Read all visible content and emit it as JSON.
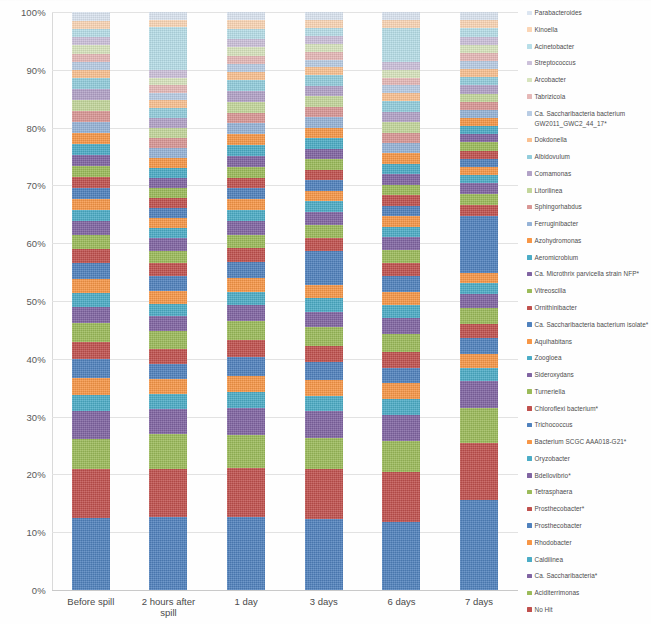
{
  "chart_data": {
    "type": "bar",
    "stacked": true,
    "stack_mode": "percent",
    "title": "",
    "xlabel": "",
    "ylabel": "",
    "ylim": [
      0,
      100
    ],
    "ytick_labels": [
      "0%",
      "10%",
      "20%",
      "30%",
      "40%",
      "50%",
      "60%",
      "70%",
      "80%",
      "90%",
      "100%"
    ],
    "ytick_values": [
      0,
      10,
      20,
      30,
      40,
      50,
      60,
      70,
      80,
      90,
      100
    ],
    "grid": true,
    "legend_position": "right",
    "categories": [
      "Before spill",
      "2 hours after spill",
      "1 day",
      "3 days",
      "6 days",
      "7 days"
    ],
    "series": [
      {
        "name": "Flavobacterium",
        "color": "#4f81bd",
        "values": [
          13.0,
          14.5,
          13.5,
          13.5,
          13.0,
          16.5
        ]
      },
      {
        "name": "No Hit",
        "color": "#c0504d",
        "values": [
          9.0,
          9.5,
          9.0,
          9.5,
          9.5,
          10.5
        ]
      },
      {
        "name": "Aciditerrimonas",
        "color": "#9bbb59",
        "values": [
          5.5,
          7.0,
          6.0,
          6.0,
          6.0,
          6.5
        ]
      },
      {
        "name": "Ca. Saccharibacteria*",
        "color": "#8064a2",
        "values": [
          5.0,
          5.0,
          5.0,
          5.0,
          5.0,
          5.0
        ]
      },
      {
        "name": "Caldilinea",
        "color": "#4bacc6",
        "values": [
          3.0,
          3.0,
          3.0,
          3.0,
          3.0,
          2.5
        ]
      },
      {
        "name": "Rhodobacter",
        "color": "#f79646",
        "values": [
          3.0,
          3.0,
          3.0,
          3.0,
          3.0,
          2.5
        ]
      },
      {
        "name": "Prosthecobacter",
        "color": "#4f81bd",
        "values": [
          3.5,
          3.0,
          3.5,
          3.5,
          3.0,
          3.0
        ]
      },
      {
        "name": "Prosthecobacter*",
        "color": "#c0504d",
        "values": [
          3.0,
          3.0,
          3.0,
          3.0,
          3.0,
          2.5
        ]
      },
      {
        "name": "Tetrasphaera",
        "color": "#9bbb59",
        "values": [
          3.5,
          3.5,
          3.5,
          3.5,
          3.5,
          3.0
        ]
      },
      {
        "name": "Bdellovibrio*",
        "color": "#8064a2",
        "values": [
          3.0,
          3.0,
          3.0,
          3.0,
          3.0,
          2.5
        ]
      },
      {
        "name": "Oryzobacter",
        "color": "#4bacc6",
        "values": [
          2.5,
          2.5,
          2.5,
          2.5,
          2.5,
          2.0
        ]
      },
      {
        "name": "Bacterium SCGC AAA018-G21*",
        "color": "#f79646",
        "values": [
          2.5,
          2.5,
          2.5,
          2.5,
          2.5,
          2.0
        ]
      },
      {
        "name": "Trichococcus",
        "color": "#4f81bd",
        "values": [
          3.0,
          3.0,
          3.0,
          6.5,
          3.0,
          10.5
        ]
      },
      {
        "name": "Chloroflexi bacterium*",
        "color": "#c0504d",
        "values": [
          2.5,
          2.5,
          2.5,
          2.5,
          2.5,
          2.0
        ]
      },
      {
        "name": "Turneriella",
        "color": "#9bbb59",
        "values": [
          2.5,
          2.5,
          2.5,
          2.5,
          2.5,
          2.0
        ]
      },
      {
        "name": "Sideroxydans",
        "color": "#8064a2",
        "values": [
          2.5,
          2.5,
          2.5,
          2.5,
          2.5,
          2.0
        ]
      },
      {
        "name": "Zoogloea",
        "color": "#4bacc6",
        "values": [
          2.0,
          2.0,
          2.0,
          2.0,
          2.0,
          1.5
        ]
      },
      {
        "name": "Aquihabitans",
        "color": "#f79646",
        "values": [
          2.0,
          2.0,
          2.0,
          2.0,
          2.0,
          1.5
        ]
      },
      {
        "name": "Ca. Saccharibacteria bacterium isolate*",
        "color": "#4f81bd",
        "values": [
          2.0,
          2.0,
          2.0,
          2.0,
          2.0,
          1.5
        ]
      },
      {
        "name": "Ornithinibacter",
        "color": "#c0504d",
        "values": [
          2.0,
          2.0,
          2.0,
          2.0,
          2.0,
          1.5
        ]
      },
      {
        "name": "Vitreoscilla",
        "color": "#9bbb59",
        "values": [
          2.0,
          2.0,
          2.0,
          2.0,
          2.0,
          1.5
        ]
      },
      {
        "name": "Ca. Microthrix parvicella strain NFP*",
        "color": "#8064a2",
        "values": [
          2.0,
          2.0,
          2.0,
          2.0,
          2.0,
          1.5
        ]
      },
      {
        "name": "Aeromicrobium",
        "color": "#4bacc6",
        "values": [
          2.0,
          2.0,
          2.0,
          2.0,
          2.0,
          1.5
        ]
      },
      {
        "name": "Azohydromonas",
        "color": "#f79646",
        "values": [
          2.0,
          2.0,
          2.0,
          2.0,
          2.0,
          1.5
        ]
      },
      {
        "name": "Ferruginibacter",
        "color": "#95b3d7",
        "values": [
          2.0,
          2.0,
          2.0,
          2.0,
          2.0,
          1.5
        ]
      },
      {
        "name": "Sphingorhabdus",
        "color": "#d99694",
        "values": [
          2.0,
          2.0,
          2.0,
          2.0,
          2.0,
          1.5
        ]
      },
      {
        "name": "Litorilinea",
        "color": "#c3d69b",
        "values": [
          2.0,
          2.0,
          2.0,
          2.0,
          2.0,
          1.5
        ]
      },
      {
        "name": "Comamonas",
        "color": "#b2a2c7",
        "values": [
          2.0,
          2.0,
          2.0,
          2.0,
          2.0,
          1.5
        ]
      },
      {
        "name": "Albidovulum",
        "color": "#92cddc",
        "values": [
          2.0,
          2.0,
          2.0,
          2.0,
          2.0,
          1.5
        ]
      },
      {
        "name": "Dokdonella",
        "color": "#fac090",
        "values": [
          1.5,
          1.5,
          1.5,
          1.5,
          1.5,
          1.5
        ]
      },
      {
        "name": "Ca. Saccharibacteria bacterium GW2011_GWC2_44_17*",
        "color": "#b8cce4",
        "values": [
          1.5,
          1.5,
          1.5,
          1.5,
          1.5,
          1.5
        ]
      },
      {
        "name": "Tabrizicola",
        "color": "#e6b8b7",
        "values": [
          1.5,
          1.5,
          1.5,
          1.5,
          1.5,
          1.5
        ]
      },
      {
        "name": "Arcobacter",
        "color": "#d7e4bd",
        "values": [
          1.5,
          1.5,
          1.5,
          1.5,
          1.5,
          1.5
        ]
      },
      {
        "name": "Streptococcus",
        "color": "#ccc0da",
        "values": [
          1.5,
          1.5,
          1.5,
          1.5,
          1.5,
          1.5
        ]
      },
      {
        "name": "Acinetobacter",
        "color": "#b7dee8",
        "values": [
          1.5,
          8.5,
          2.0,
          1.5,
          6.5,
          1.5
        ]
      },
      {
        "name": "Kinoella",
        "color": "#fbd5b5",
        "values": [
          1.5,
          1.5,
          1.5,
          1.5,
          1.5,
          1.5
        ]
      },
      {
        "name": "Parabacteroides",
        "color": "#dbe5f1",
        "values": [
          1.5,
          1.5,
          1.5,
          1.5,
          1.5,
          1.5
        ]
      }
    ],
    "legend_entries": [
      {
        "label": "Parabacteroides",
        "color": "#dbe5f1"
      },
      {
        "label": "Kinoella",
        "color": "#fbd5b5"
      },
      {
        "label": "Acinetobacter",
        "color": "#b7dee8"
      },
      {
        "label": "Streptococcus",
        "color": "#ccc0da"
      },
      {
        "label": "Arcobacter",
        "color": "#d7e4bd"
      },
      {
        "label": "Tabrizicola",
        "color": "#e6b8b7"
      },
      {
        "label": "Ca. Saccharibacteria bacterium GW2011_GWC2_44_17*",
        "color": "#b8cce4"
      },
      {
        "label": "Dokdonella",
        "color": "#fac090"
      },
      {
        "label": "Albidovulum",
        "color": "#92cddc"
      },
      {
        "label": "Comamonas",
        "color": "#b2a2c7"
      },
      {
        "label": "Litorilinea",
        "color": "#c3d69b"
      },
      {
        "label": "Sphingorhabdus",
        "color": "#d99694"
      },
      {
        "label": "Ferruginibacter",
        "color": "#95b3d7"
      },
      {
        "label": "Azohydromonas",
        "color": "#f79646"
      },
      {
        "label": "Aeromicrobium",
        "color": "#4bacc6"
      },
      {
        "label": "Ca. Microthrix parvicella strain NFP*",
        "color": "#8064a2"
      },
      {
        "label": "Vitreoscilla",
        "color": "#9bbb59"
      },
      {
        "label": "Ornithinibacter",
        "color": "#c0504d"
      },
      {
        "label": "Ca. Saccharibacteria bacterium isolate*",
        "color": "#4f81bd"
      },
      {
        "label": "Aquihabitans",
        "color": "#f79646"
      },
      {
        "label": "Zoogloea",
        "color": "#4bacc6"
      },
      {
        "label": "Sideroxydans",
        "color": "#8064a2"
      },
      {
        "label": "Turneriella",
        "color": "#9bbb59"
      },
      {
        "label": "Chloroflexi bacterium*",
        "color": "#c0504d"
      },
      {
        "label": "Trichococcus",
        "color": "#4f81bd"
      },
      {
        "label": "Bacterium SCGC AAA018-G21*",
        "color": "#f79646"
      },
      {
        "label": "Oryzobacter",
        "color": "#4bacc6"
      },
      {
        "label": "Bdellovibrio*",
        "color": "#8064a2"
      },
      {
        "label": "Tetrasphaera",
        "color": "#9bbb59"
      },
      {
        "label": "Prosthecobacter*",
        "color": "#c0504d"
      },
      {
        "label": "Prosthecobacter",
        "color": "#4f81bd"
      },
      {
        "label": "Rhodobacter",
        "color": "#f79646"
      },
      {
        "label": "Caldilinea",
        "color": "#4bacc6"
      },
      {
        "label": "Ca. Saccharibacteria*",
        "color": "#8064a2"
      },
      {
        "label": "Aciditerrimonas",
        "color": "#9bbb59"
      },
      {
        "label": "No Hit",
        "color": "#c0504d"
      },
      {
        "label": "Flavobacterium",
        "color": "#4f81bd"
      }
    ]
  }
}
